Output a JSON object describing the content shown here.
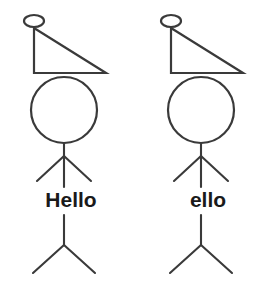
{
  "canvas": {
    "width": 273,
    "height": 288,
    "background_color": "#ffffff",
    "stroke_color": "#3a3a3a",
    "text_color": "#1a1a1a"
  },
  "figures": [
    {
      "id": "left-figure",
      "label": "Hello",
      "label_x": 71,
      "label_y": 207,
      "origin_x": 0,
      "hat": {
        "knob_cx": 34,
        "knob_cy": 21,
        "knob_rx": 10,
        "knob_ry": 6,
        "apex_x": 34,
        "apex_y": 28,
        "corner_x": 34,
        "corner_y": 73,
        "tip_x": 106,
        "tip_y": 73
      },
      "head": {
        "cx": 64,
        "cy": 110,
        "r": 33
      },
      "neck": {
        "x": 64,
        "y1": 143,
        "y2": 156
      },
      "arms": {
        "vertex_x": 64,
        "vertex_y": 156,
        "left_x": 37,
        "left_y": 181,
        "right_x": 91,
        "right_y": 181,
        "torso_y": 187
      },
      "lower_torso": {
        "x": 64,
        "y1": 215,
        "y2": 245
      },
      "legs": {
        "vertex_x": 64,
        "vertex_y": 245,
        "left_x": 33,
        "left_y": 273,
        "right_x": 95,
        "right_y": 273
      }
    },
    {
      "id": "right-figure",
      "label": "ello",
      "label_x": 208,
      "label_y": 207,
      "origin_x": 137,
      "hat": {
        "knob_cx": 171,
        "knob_cy": 21,
        "knob_rx": 10,
        "knob_ry": 6,
        "apex_x": 171,
        "apex_y": 28,
        "corner_x": 171,
        "corner_y": 73,
        "tip_x": 243,
        "tip_y": 73
      },
      "head": {
        "cx": 201,
        "cy": 110,
        "r": 33
      },
      "neck": {
        "x": 201,
        "y1": 143,
        "y2": 156
      },
      "arms": {
        "vertex_x": 201,
        "vertex_y": 156,
        "left_x": 174,
        "left_y": 181,
        "right_x": 228,
        "right_y": 181,
        "torso_y": 187
      },
      "lower_torso": {
        "x": 201,
        "y1": 215,
        "y2": 245
      },
      "legs": {
        "vertex_x": 201,
        "vertex_y": 245,
        "left_x": 170,
        "left_y": 273,
        "right_x": 232,
        "right_y": 273
      }
    }
  ]
}
